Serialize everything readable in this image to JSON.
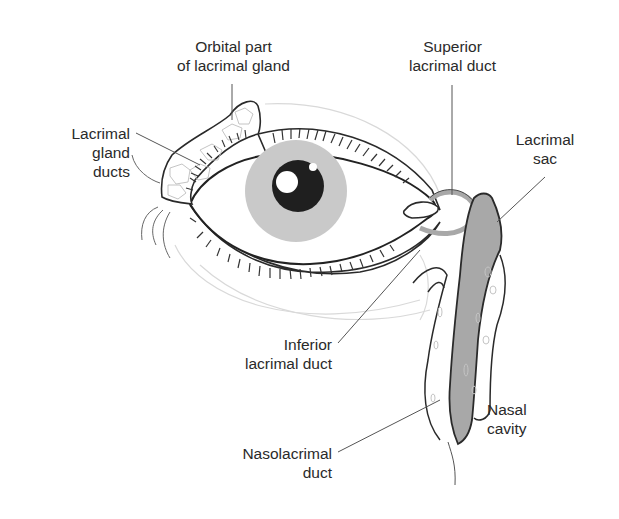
{
  "figure": {
    "colors": {
      "outline": "#2a2a2a",
      "leader_line": "#555555",
      "iris": "#c9c9c9",
      "pupil": "#1f1f1f",
      "duct_fill": "#a8a8a8",
      "gland_cells": "#bdbdbd",
      "faint_contour": "#d6d6d6"
    }
  },
  "labels": {
    "orbital_part": {
      "line1": "Orbital part",
      "line2": "of lacrimal gland"
    },
    "superior_duct": {
      "line1": "Superior",
      "line2": "lacrimal duct"
    },
    "gland_ducts": {
      "line1": "Lacrimal",
      "line2": "gland",
      "line3": "ducts"
    },
    "lacrimal_sac": {
      "line1": "Lacrimal",
      "line2": "sac"
    },
    "inferior_duct": {
      "line1": "Inferior",
      "line2": "lacrimal duct"
    },
    "nasal_cavity": {
      "line1": "Nasal",
      "line2": "cavity"
    },
    "nasolacrimal_duct": {
      "line1": "Nasolacrimal",
      "line2": "duct"
    }
  }
}
